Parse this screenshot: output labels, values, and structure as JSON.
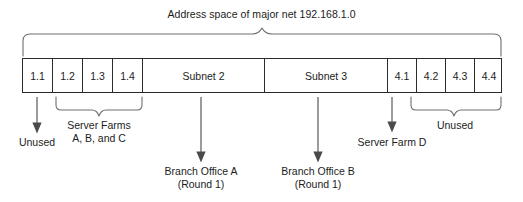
{
  "diagram": {
    "title": "Address space of major net 192.168.1.0",
    "bar": {
      "cells": [
        {
          "label": "1.1",
          "width": 30
        },
        {
          "label": "1.2",
          "width": 30
        },
        {
          "label": "1.3",
          "width": 30
        },
        {
          "label": "1.4",
          "width": 30
        },
        {
          "label": "Subnet 2",
          "width": 122
        },
        {
          "label": "Subnet 3",
          "width": 123
        },
        {
          "label": "4.1",
          "width": 29
        },
        {
          "label": "4.2",
          "width": 29
        },
        {
          "label": "4.3",
          "width": 29
        },
        {
          "label": "4.4",
          "width": 28
        }
      ]
    },
    "annotations": {
      "unused_left": "Unused",
      "server_farms_line1": "Server Farms",
      "server_farms_line2": "A, B, and C",
      "branch_office_a_line1": "Branch Office A",
      "branch_office_a_line2": "(Round 1)",
      "branch_office_b_line1": "Branch Office B",
      "branch_office_b_line2": "(Round 1)",
      "server_farm_d": "Server Farm D",
      "unused_right": "Unused"
    },
    "colors": {
      "stroke": "#2b2b2b",
      "brace": "#6e6e6e",
      "text": "#1c1c1c",
      "background": "#ffffff"
    }
  }
}
